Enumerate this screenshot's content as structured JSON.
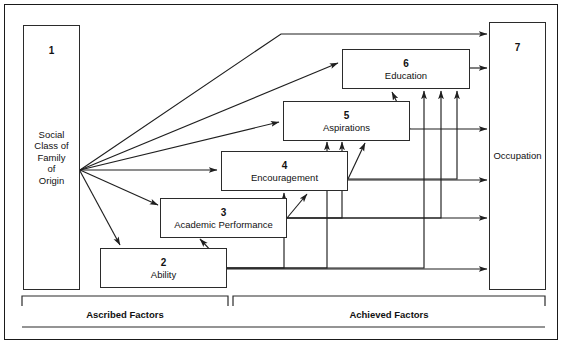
{
  "diagram": {
    "type": "path-diagram",
    "title": "",
    "nodes": [
      {
        "id": "n1",
        "number": "1",
        "label": "Social\nClass of\nFamily\nof\nOrigin",
        "label_lines": [
          "Social",
          "Class of",
          "Family",
          "of",
          "Origin"
        ]
      },
      {
        "id": "n2",
        "number": "2",
        "label": "Ability",
        "label_lines": [
          "Ability"
        ]
      },
      {
        "id": "n3",
        "number": "3",
        "label": "Academic Performance",
        "label_lines": [
          "Academic Performance"
        ]
      },
      {
        "id": "n4",
        "number": "4",
        "label": "Encouragement",
        "label_lines": [
          "Encouragement"
        ]
      },
      {
        "id": "n5",
        "number": "5",
        "label": "Aspirations",
        "label_lines": [
          "Aspirations"
        ]
      },
      {
        "id": "n6",
        "number": "6",
        "label": "Education",
        "label_lines": [
          "Education"
        ]
      },
      {
        "id": "n7",
        "number": "7",
        "label": "Occupation",
        "label_lines": [
          "Occupation"
        ]
      }
    ],
    "groups": [
      {
        "id": "ascribed",
        "label": "Ascribed Factors"
      },
      {
        "id": "achieved",
        "label": "Achieved Factors"
      }
    ],
    "edges": [
      {
        "from": "1",
        "to": "7"
      },
      {
        "from": "1",
        "to": "6"
      },
      {
        "from": "1",
        "to": "5"
      },
      {
        "from": "1",
        "to": "4"
      },
      {
        "from": "1",
        "to": "3"
      },
      {
        "from": "1",
        "to": "2"
      },
      {
        "from": "2",
        "to": "3"
      },
      {
        "from": "2",
        "to": "4"
      },
      {
        "from": "2",
        "to": "5"
      },
      {
        "from": "2",
        "to": "6"
      },
      {
        "from": "2",
        "to": "7"
      },
      {
        "from": "3",
        "to": "4"
      },
      {
        "from": "3",
        "to": "5"
      },
      {
        "from": "3",
        "to": "6"
      },
      {
        "from": "3",
        "to": "7"
      },
      {
        "from": "4",
        "to": "5"
      },
      {
        "from": "4",
        "to": "6"
      },
      {
        "from": "4",
        "to": "7"
      },
      {
        "from": "5",
        "to": "6"
      },
      {
        "from": "5",
        "to": "7"
      },
      {
        "from": "6",
        "to": "7"
      }
    ],
    "colors": {
      "stroke": "#2b2b2b",
      "background": "#ffffff",
      "text": "#111111"
    }
  }
}
